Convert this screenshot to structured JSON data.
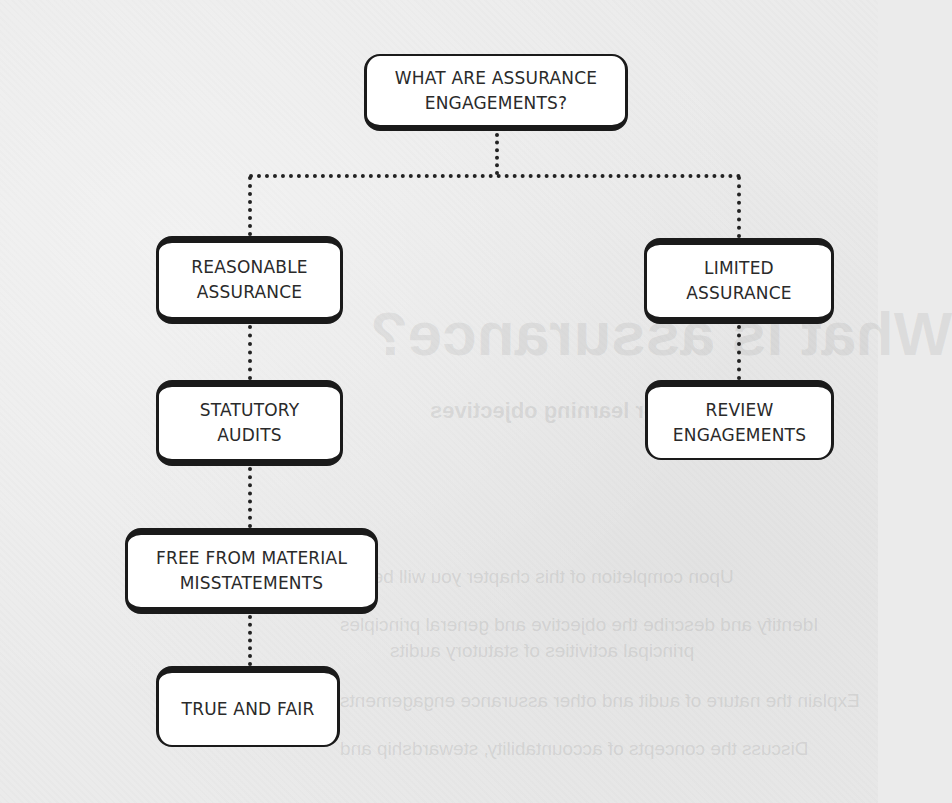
{
  "diagram": {
    "type": "tree",
    "connector_style": "dotted",
    "colors": {
      "background": "#ebebeb",
      "box_fill": "#ffffff",
      "box_border": "#1a1a1a",
      "text": "#2a2a2a"
    },
    "root": {
      "id": "root",
      "label": "WHAT ARE ASSURANCE\nENGAGEMENTS?"
    },
    "branches": {
      "left": {
        "reasonable": {
          "id": "reasonable",
          "label": "REASONABLE\nASSURANCE"
        },
        "statutory": {
          "id": "statutory",
          "label": "STATUTORY\nAUDITS"
        },
        "free_from": {
          "id": "free_from",
          "label": "FREE FROM MATERIAL\nMISSTATEMENTS"
        },
        "true_fair": {
          "id": "true_fair",
          "label": "TRUE AND FAIR"
        }
      },
      "right": {
        "limited": {
          "id": "limited",
          "label": "LIMITED\nASSURANCE"
        },
        "review": {
          "id": "review",
          "label": "REVIEW\nENGAGEMENTS"
        }
      }
    },
    "edges": [
      [
        "root",
        "reasonable"
      ],
      [
        "root",
        "limited"
      ],
      [
        "reasonable",
        "statutory"
      ],
      [
        "statutory",
        "free_from"
      ],
      [
        "free_from",
        "true_fair"
      ],
      [
        "limited",
        "review"
      ]
    ]
  },
  "show_through": {
    "title": "What is assurance?",
    "subtitle": "After learning objectives",
    "lines": [
      "Upon completion of this chapter you will be able to:",
      "Identify and describe the objective and general principles",
      "principal activities of statutory audits",
      "Explain the nature of audit and other assurance engagements",
      "Discuss the concepts of accountability, stewardship and"
    ]
  }
}
